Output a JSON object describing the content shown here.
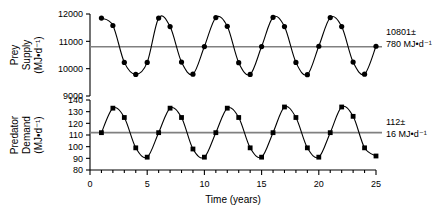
{
  "figure": {
    "background": "#ffffff",
    "axis_color": "#000000",
    "mean_line_color": "#808080",
    "curve_color": "#000000",
    "marker_color": "#000000"
  },
  "x_axis": {
    "label": "Time (years)",
    "ticks": [
      0,
      5,
      10,
      15,
      20,
      25
    ],
    "minor_tick_step": 1,
    "range": [
      0,
      25
    ]
  },
  "panels": [
    {
      "id": "prey-supply",
      "y_label_lines": [
        "Prey",
        "Supply",
        "(MJ•d⁻¹)"
      ],
      "marker": "circle",
      "annotation_lines": [
        "10801±",
        "780 MJ•d⁻¹"
      ]
    },
    {
      "id": "predator-demand",
      "y_label_lines": [
        "Predator",
        "Demand",
        "(MJ•d⁻¹)"
      ],
      "marker": "square",
      "annotation_lines": [
        "112±",
        "16 MJ•d⁻¹"
      ]
    }
  ],
  "chart_data": [
    {
      "type": "line",
      "id": "prey-supply",
      "title": "",
      "xlabel": "Time (years)",
      "ylabel": "Prey Supply (MJ•d⁻¹)",
      "xlim": [
        0,
        25
      ],
      "ylim": [
        9000,
        12000
      ],
      "yticks": [
        9000,
        10000,
        11000,
        12000
      ],
      "xticks": [
        0,
        5,
        10,
        15,
        20,
        25
      ],
      "grid": false,
      "legend": "none",
      "mean_line": {
        "value": 10801,
        "label": "10801± 780 MJ•d⁻¹",
        "color": "#808080"
      },
      "mean": 10801,
      "sd": 780,
      "period_years": 5,
      "x": [
        1,
        2,
        3,
        4,
        5,
        6,
        7,
        8,
        9,
        10,
        11,
        12,
        13,
        14,
        15,
        16,
        17,
        18,
        19,
        20,
        21,
        22,
        23,
        24,
        25
      ],
      "values": [
        11850,
        11580,
        10230,
        9790,
        10230,
        11850,
        11540,
        10240,
        9800,
        10810,
        11870,
        11550,
        10220,
        9790,
        10810,
        11880,
        11540,
        10230,
        9780,
        10820,
        11870,
        11540,
        10240,
        9800,
        10820
      ],
      "annotation": {
        "text_lines": [
          "10801±",
          "780 MJ•d⁻¹"
        ],
        "position": "right-of-mean-line"
      }
    },
    {
      "type": "line",
      "id": "predator-demand",
      "title": "",
      "xlabel": "Time (years)",
      "ylabel": "Predator Demand (MJ•d⁻¹)",
      "xlim": [
        0,
        25
      ],
      "ylim": [
        80,
        140
      ],
      "yticks": [
        80,
        90,
        100,
        110,
        120,
        130,
        140
      ],
      "xticks": [
        0,
        5,
        10,
        15,
        20,
        25
      ],
      "grid": false,
      "legend": "none",
      "mean_line": {
        "value": 112,
        "label": "112± 16 MJ•d⁻¹",
        "color": "#808080"
      },
      "mean": 112,
      "sd": 16,
      "period_years": 5,
      "x": [
        1,
        2,
        3,
        4,
        5,
        6,
        7,
        8,
        9,
        10,
        11,
        12,
        13,
        14,
        15,
        16,
        17,
        18,
        19,
        20,
        21,
        22,
        23,
        24,
        25
      ],
      "values": [
        112,
        133,
        125,
        99,
        91,
        112,
        133,
        125,
        98,
        91,
        112,
        133,
        125,
        99,
        91,
        112,
        134,
        125,
        99,
        91,
        112,
        134,
        126,
        99,
        92
      ],
      "annotation": {
        "text_lines": [
          "112±",
          "16 MJ•d⁻¹"
        ],
        "position": "right-of-mean-line"
      }
    }
  ]
}
